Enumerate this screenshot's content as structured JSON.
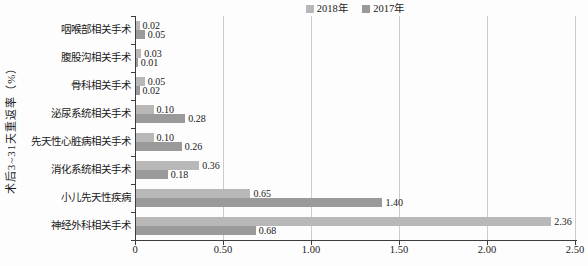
{
  "chart_data": {
    "type": "bar",
    "orientation": "horizontal",
    "title": "",
    "xlabel": "",
    "ylabel": "术后3~31天重返率（%）",
    "categories": [
      "咽喉部相关手术",
      "腹股沟相关手术",
      "骨科相关手术",
      "泌尿系统相关手术",
      "先天性心脏病相关手术",
      "消化系统相关手术",
      "小儿先天性疾病",
      "神经外科相关手术"
    ],
    "series": [
      {
        "name": "2018年",
        "color": "#b8b8b8",
        "values": [
          0.02,
          0.03,
          0.05,
          0.1,
          0.1,
          0.36,
          0.65,
          2.36
        ]
      },
      {
        "name": "2017年",
        "color": "#9a9a9a",
        "values": [
          0.05,
          0.01,
          0.02,
          0.28,
          0.26,
          0.18,
          1.4,
          0.68
        ]
      }
    ],
    "value_label_format": "0.00",
    "xlim": [
      0,
      2.5
    ],
    "x_ticks": [
      {
        "value": 0.0,
        "label": "0"
      },
      {
        "value": 0.5,
        "label": "0.50"
      },
      {
        "value": 1.0,
        "label": "1.00"
      },
      {
        "value": 1.5,
        "label": "1.50"
      },
      {
        "value": 2.0,
        "label": "2.00"
      },
      {
        "value": 2.5,
        "label": "2.50"
      }
    ],
    "grid": true,
    "legend_position": "top",
    "colors": {
      "grid": "#cccccc",
      "axis": "#3d3d3d",
      "text": "#1a1a1a"
    }
  }
}
